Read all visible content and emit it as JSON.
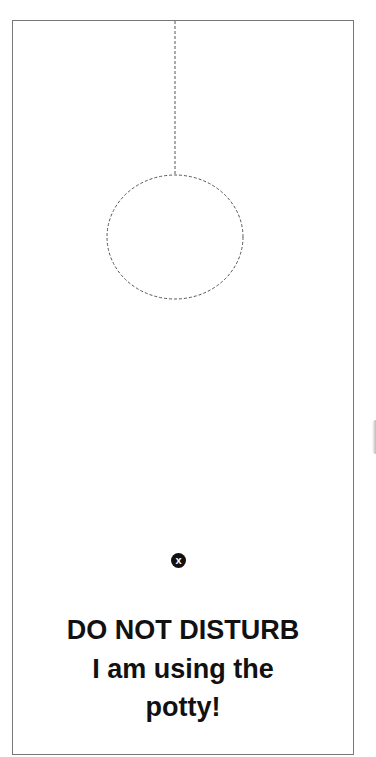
{
  "sign": {
    "headline": "DO NOT DISTURB",
    "line2": "I am using the",
    "line3": "potty!"
  },
  "badge": {
    "icon": "close-x-icon",
    "glyph": "x"
  },
  "colors": {
    "border": "#777777",
    "dashed_cutline": "#555555",
    "text": "#111111",
    "background": "#ffffff"
  }
}
